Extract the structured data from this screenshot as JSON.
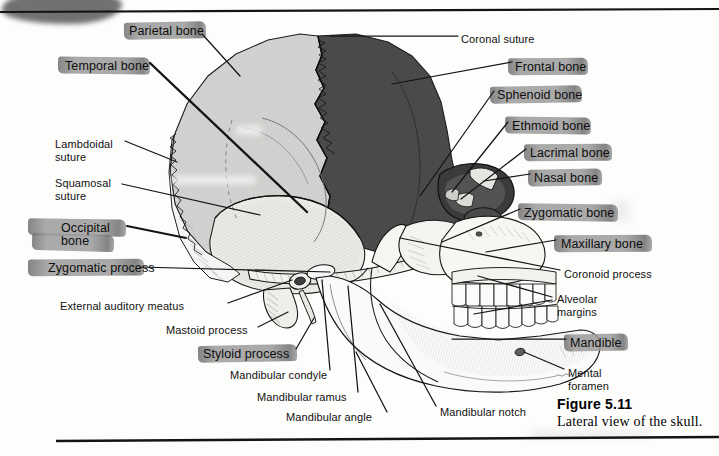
{
  "figure": {
    "number": "Figure 5.11",
    "caption": "Lateral view of the skull.",
    "view": "lateral"
  },
  "colors": {
    "highlighter": "#9b9b9b",
    "highlighter_dark": "#6f6f6f",
    "frontal_bone_fill": "#4d4d4d",
    "parietal_bone_fill": "#cfcfcf",
    "temporal_bone_fill": "#e3e3e1",
    "facial_bone_fill": "#f4f3f0",
    "ink": "#161616",
    "leader_line": "#1a1a1a",
    "rule": "#141414",
    "page_background": "#fdfdfc"
  },
  "labels_highlighted": [
    {
      "id": "parietal-bone",
      "text": "Parietal bone",
      "x": 129,
      "y": 25,
      "hl_x": 124,
      "hl_y": 22,
      "hl_w": 82,
      "hl_h": 17
    },
    {
      "id": "temporal-bone",
      "text": "Temporal bone",
      "x": 65,
      "y": 60,
      "hl_x": 58,
      "hl_y": 57,
      "hl_w": 92,
      "hl_h": 17
    },
    {
      "id": "frontal-bone",
      "text": "Frontal bone",
      "x": 515,
      "y": 61,
      "hl_x": 508,
      "hl_y": 58,
      "hl_w": 80,
      "hl_h": 17
    },
    {
      "id": "sphenoid-bone",
      "text": "Sphenoid bone",
      "x": 497,
      "y": 89,
      "hl_x": 490,
      "hl_y": 86,
      "hl_w": 92,
      "hl_h": 17
    },
    {
      "id": "ethmoid-bone",
      "text": "Ethmoid bone",
      "x": 512,
      "y": 120,
      "hl_x": 505,
      "hl_y": 117,
      "hl_w": 86,
      "hl_h": 17
    },
    {
      "id": "lacrimal-bone",
      "text": "Lacrimal bone",
      "x": 530,
      "y": 147,
      "hl_x": 524,
      "hl_y": 144,
      "hl_w": 88,
      "hl_h": 17
    },
    {
      "id": "nasal-bone",
      "text": "Nasal bone",
      "x": 534,
      "y": 172,
      "hl_x": 528,
      "hl_y": 169,
      "hl_w": 74,
      "hl_h": 17
    },
    {
      "id": "zygomatic-bone",
      "text": "Zygomatic bone",
      "x": 524,
      "y": 207,
      "hl_x": 518,
      "hl_y": 204,
      "hl_w": 100,
      "hl_h": 17
    },
    {
      "id": "maxillary-bone",
      "text": "Maxillary bone",
      "x": 561,
      "y": 238,
      "hl_x": 554,
      "hl_y": 235,
      "hl_w": 98,
      "hl_h": 17
    },
    {
      "id": "mandible",
      "text": "Mandible",
      "x": 570,
      "y": 337,
      "hl_x": 564,
      "hl_y": 334,
      "hl_w": 64,
      "hl_h": 17
    },
    {
      "id": "occipital-bone",
      "text": "Occipital\nbone",
      "x": 61,
      "y": 222,
      "hl_x": 28,
      "hl_y": 219,
      "hl_w": 98,
      "hl_h": 17
    },
    {
      "id": "zygomatic-process",
      "text": "Zygomatic process",
      "x": 48,
      "y": 262,
      "hl_x": 28,
      "hl_y": 259,
      "hl_w": 116,
      "hl_h": 17
    },
    {
      "id": "styloid-process",
      "text": "Styloid process",
      "x": 203,
      "y": 348,
      "hl_x": 198,
      "hl_y": 345,
      "hl_w": 99,
      "hl_h": 17
    }
  ],
  "labels_plain": [
    {
      "id": "coronal-suture",
      "text": "Coronal suture",
      "x": 461,
      "y": 33
    },
    {
      "id": "lambdoidal-suture",
      "text": "Lambdoidal\nsuture",
      "x": 55,
      "y": 138
    },
    {
      "id": "squamosal-suture",
      "text": "Squamosal\nsuture",
      "x": 55,
      "y": 177
    },
    {
      "id": "external-auditory-meatus",
      "text": "External auditory meatus",
      "x": 60,
      "y": 300
    },
    {
      "id": "mastoid-process",
      "text": "Mastoid process",
      "x": 166,
      "y": 324
    },
    {
      "id": "mandibular-condyle",
      "text": "Mandibular condyle",
      "x": 230,
      "y": 369
    },
    {
      "id": "mandibular-ramus",
      "text": "Mandibular ramus",
      "x": 257,
      "y": 391
    },
    {
      "id": "mandibular-angle",
      "text": "Mandibular angle",
      "x": 286,
      "y": 411
    },
    {
      "id": "mandibular-notch",
      "text": "Mandibular notch",
      "x": 440,
      "y": 406
    },
    {
      "id": "coronoid-process",
      "text": "Coronoid process",
      "x": 564,
      "y": 268
    },
    {
      "id": "alveolar-margins",
      "text": "Alveolar\nmargins",
      "x": 557,
      "y": 293
    },
    {
      "id": "mental-foramen",
      "text": "Mental\nforamen",
      "x": 568,
      "y": 367
    }
  ],
  "anatomy_regions": [
    {
      "name": "parietal-bone",
      "shading": "light-gray"
    },
    {
      "name": "frontal-bone",
      "shading": "dark-gray"
    },
    {
      "name": "temporal-bone",
      "shading": "pale-gray"
    },
    {
      "name": "occipital-bone",
      "shading": "white"
    },
    {
      "name": "mandible",
      "shading": "white"
    },
    {
      "name": "maxilla",
      "shading": "white"
    }
  ]
}
